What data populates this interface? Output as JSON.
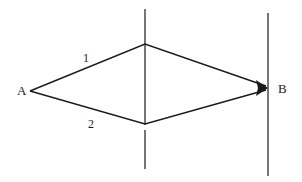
{
  "diagram": {
    "type": "two-path interference (double slit)",
    "points": {
      "source": {
        "label": "A",
        "x": 30,
        "y": 91
      },
      "detector": {
        "label": "B",
        "x": 268,
        "y": 88
      }
    },
    "paths": [
      {
        "label": "1",
        "via": "upper slit"
      },
      {
        "label": "2",
        "via": "lower slit"
      }
    ],
    "barriers": [
      {
        "name": "slit-screen",
        "x": 145
      },
      {
        "name": "detection-screen",
        "x": 268
      }
    ],
    "colors": {
      "line": "#1a1a1a",
      "background": "#ffffff"
    }
  }
}
